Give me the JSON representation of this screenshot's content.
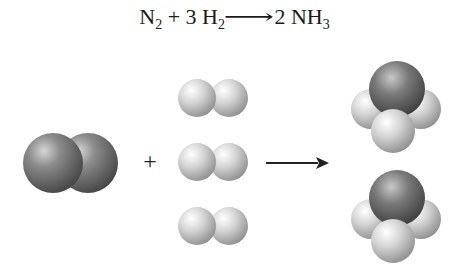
{
  "equation": {
    "reactant1": "N",
    "reactant1_sub": "2",
    "plus": "+",
    "coef2": "3",
    "reactant2": "H",
    "reactant2_sub": "2",
    "arrow": "⟶",
    "coef3": "2",
    "product": "NH",
    "product_sub": "3"
  },
  "diagram": {
    "plus_sign": "+",
    "molecules": {
      "nitrogen": {
        "label": "N2",
        "count": 1
      },
      "hydrogen": {
        "label": "H2",
        "count": 3
      },
      "ammonia": {
        "label": "NH3",
        "count": 2
      }
    },
    "colors": {
      "nitrogen_atom": "#6e6e6e",
      "hydrogen_atom": "#d8d8d8",
      "arrow": "#222222"
    }
  }
}
